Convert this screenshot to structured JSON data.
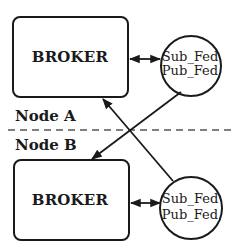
{
  "diagram": {
    "nodes": [
      {
        "id": "node-a",
        "label": "Node A",
        "broker": {
          "label": "BROKER"
        },
        "federation": {
          "line1": "Sub_Fed",
          "line2": "Pub_Fed"
        }
      },
      {
        "id": "node-b",
        "label": "Node B",
        "broker": {
          "label": "BROKER"
        },
        "federation": {
          "line1": "Sub_Fed",
          "line2": "Pub_Fed"
        }
      }
    ],
    "edges": [
      {
        "from": "node-a.broker",
        "to": "node-a.federation",
        "type": "bidirectional"
      },
      {
        "from": "node-b.broker",
        "to": "node-b.federation",
        "type": "bidirectional"
      },
      {
        "from": "node-a.federation",
        "to": "node-b.broker",
        "type": "directed"
      },
      {
        "from": "node-b.federation",
        "to": "node-a.broker",
        "type": "directed"
      }
    ],
    "separator": {
      "style": "dashed"
    },
    "colors": {
      "stroke": "#1a1a1a",
      "background": "#ffffff"
    }
  }
}
